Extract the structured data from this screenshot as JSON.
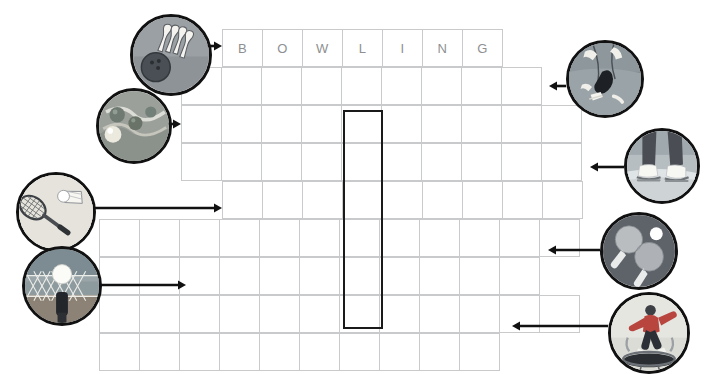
{
  "puzzle": {
    "title": "Sports Crossword Puzzle",
    "grid": {
      "cell_width": 41,
      "cell_height": 38,
      "rows": 9,
      "border_color": "#c9cacb",
      "letter_color": "#8d8f91"
    },
    "answer_column": {
      "label": "highlighted-vertical-answer-column",
      "outline_color": "#1a1a1a",
      "column_index_from_left_of_row1": 4,
      "start_row": 3,
      "end_row": 8
    },
    "rows": [
      {
        "index": 1,
        "left": 222,
        "top": 29,
        "cells": [
          "B",
          "O",
          "W",
          "L",
          "I",
          "N",
          "G"
        ],
        "filled": true
      },
      {
        "index": 2,
        "left": 181,
        "top": 67,
        "cells": [
          "",
          "",
          "",
          "",
          "",
          "",
          "",
          "",
          ""
        ],
        "filled": false
      },
      {
        "index": 3,
        "left": 181,
        "top": 105,
        "cells": [
          "",
          "",
          "",
          "",
          "",
          "",
          "",
          "",
          "",
          ""
        ],
        "filled": false
      },
      {
        "index": 4,
        "left": 181,
        "top": 143,
        "cells": [
          "",
          "",
          "",
          "",
          "",
          "",
          "",
          "",
          "",
          ""
        ],
        "filled": false
      },
      {
        "index": 5,
        "left": 222,
        "top": 181,
        "cells": [
          "",
          "",
          "",
          "",
          "",
          "",
          "",
          "",
          ""
        ],
        "filled": false
      },
      {
        "index": 6,
        "left": 99,
        "top": 219,
        "cells": [
          "",
          "",
          "",
          "",
          "",
          "",
          "",
          "",
          "",
          "",
          "",
          ""
        ],
        "filled": false
      },
      {
        "index": 7,
        "left": 99,
        "top": 257,
        "cells": [
          "",
          "",
          "",
          "",
          "",
          "",
          "",
          "",
          "",
          "",
          ""
        ],
        "filled": false
      },
      {
        "index": 8,
        "left": 99,
        "top": 295,
        "cells": [
          "",
          "",
          "",
          "",
          "",
          "",
          "",
          "",
          "",
          "",
          "",
          ""
        ],
        "filled": false
      },
      {
        "index": 9,
        "left": 99,
        "top": 333,
        "cells": [
          "",
          "",
          "",
          "",
          "",
          "",
          "",
          "",
          "",
          ""
        ],
        "filled": false
      }
    ],
    "clues": [
      {
        "id": 1,
        "name": "clue-bowling",
        "icon": "bowling-pins-and-ball-icon",
        "side": "left",
        "x": 130,
        "y": 14,
        "size": 82,
        "row": 1,
        "arrow_from_x": 206,
        "arrow_to_x": 222,
        "arrow_y": 46
      },
      {
        "id": 2,
        "name": "clue-marbles",
        "icon": "marbles-game-icon",
        "side": "left",
        "x": 96,
        "y": 88,
        "size": 76,
        "row": 3,
        "arrow_from_x": 164,
        "arrow_to_x": 181,
        "arrow_y": 124
      },
      {
        "id": 3,
        "name": "clue-badminton",
        "icon": "badminton-racket-and-shuttlecock-icon",
        "side": "left",
        "x": 16,
        "y": 172,
        "size": 80,
        "row": 5,
        "arrow_from_x": 94,
        "arrow_to_x": 222,
        "arrow_y": 208
      },
      {
        "id": 4,
        "name": "clue-volleyball",
        "icon": "volleyball-net-and-ball-icon",
        "side": "left",
        "x": 22,
        "y": 246,
        "size": 80,
        "row": 7,
        "arrow_from_x": 100,
        "arrow_to_x": 186,
        "arrow_y": 285
      },
      {
        "id": 5,
        "name": "clue-figure-skating",
        "icon": "figure-skater-icon",
        "side": "right",
        "x": 566,
        "y": 40,
        "size": 78,
        "row": 2,
        "arrow_from_x": 566,
        "arrow_to_x": 549,
        "arrow_y": 86
      },
      {
        "id": 6,
        "name": "clue-ice-skates",
        "icon": "ice-skates-icon",
        "side": "right",
        "x": 624,
        "y": 128,
        "size": 76,
        "row": 4,
        "arrow_from_x": 624,
        "arrow_to_x": 590,
        "arrow_y": 167
      },
      {
        "id": 7,
        "name": "clue-table-tennis",
        "icon": "table-tennis-paddles-icon",
        "side": "right",
        "x": 600,
        "y": 212,
        "size": 78,
        "row": 6,
        "arrow_from_x": 600,
        "arrow_to_x": 548,
        "arrow_y": 250
      },
      {
        "id": 8,
        "name": "clue-trampoline",
        "icon": "trampoline-jumper-icon",
        "side": "right",
        "x": 608,
        "y": 292,
        "size": 82,
        "row": 9,
        "arrow_from_x": 608,
        "arrow_to_x": 512,
        "arrow_y": 326
      }
    ],
    "arrow_color": "#111111"
  }
}
